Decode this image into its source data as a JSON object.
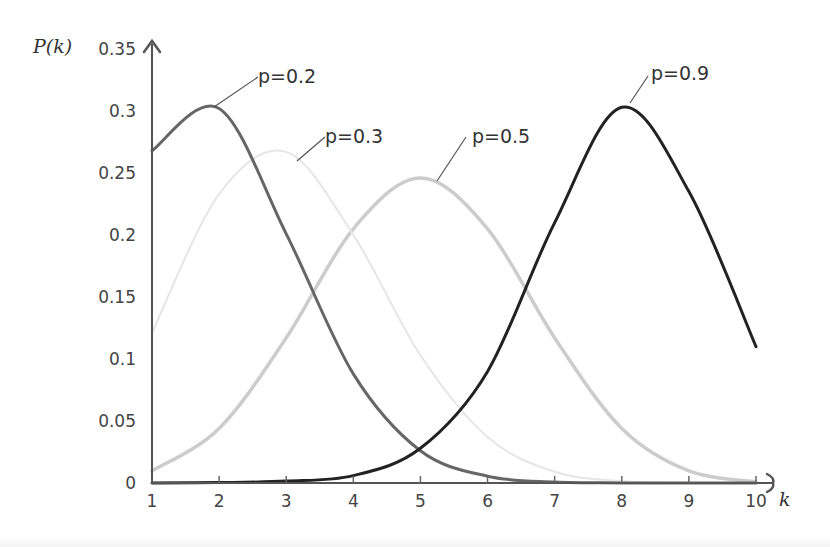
{
  "chart_data": {
    "type": "line",
    "title": "",
    "xlabel": "k",
    "ylabel": "P(k)",
    "x": [
      1,
      2,
      3,
      4,
      5,
      6,
      7,
      8,
      9,
      10
    ],
    "xlim": [
      1,
      10
    ],
    "ylim": [
      0,
      0.35
    ],
    "x_ticks": [
      "1",
      "2",
      "3",
      "4",
      "5",
      "6",
      "7",
      "8",
      "9",
      "10"
    ],
    "y_ticks": [
      "0",
      "0.05",
      "0.1",
      "0.15",
      "0.2",
      "0.25",
      "0.3",
      "0.35"
    ],
    "y_tick_values": [
      0,
      0.05,
      0.1,
      0.15,
      0.2,
      0.25,
      0.3,
      0.35
    ],
    "grid": false,
    "legend": "inline labels with leader lines",
    "series": [
      {
        "name": "p=0.2",
        "color": "#666666",
        "width": 3,
        "values": [
          0.268,
          0.302,
          0.201,
          0.088,
          0.026,
          0.0055,
          0.0008,
          0.0001,
          0.0,
          0.0
        ]
      },
      {
        "name": "p=0.3",
        "color": "#e6e6e6",
        "width": 2,
        "values": [
          0.121,
          0.233,
          0.267,
          0.2,
          0.103,
          0.037,
          0.009,
          0.0014,
          0.0001,
          0.0
        ]
      },
      {
        "name": "p=0.5",
        "color": "#cccccc",
        "width": 3.5,
        "values": [
          0.0098,
          0.044,
          0.117,
          0.205,
          0.246,
          0.205,
          0.117,
          0.044,
          0.0098,
          0.001
        ]
      },
      {
        "name": "p=0.9",
        "color": "#222222",
        "width": 3,
        "values": [
          0.0,
          0.0003,
          0.0015,
          0.006,
          0.028,
          0.09,
          0.21,
          0.303,
          0.235,
          0.11
        ]
      }
    ],
    "annotations": [
      {
        "text": "p=0.2",
        "label_x": 258,
        "label_y": 83,
        "leader": [
          [
            258,
            77
          ],
          [
            214,
            107
          ]
        ]
      },
      {
        "text": "p=0.3",
        "label_x": 325,
        "label_y": 143,
        "leader": [
          [
            325,
            137
          ],
          [
            297,
            161
          ]
        ]
      },
      {
        "text": "p=0.5",
        "label_x": 472,
        "label_y": 143,
        "leader": [
          [
            466,
            137
          ],
          [
            437,
            181
          ]
        ]
      },
      {
        "text": "p=0.9",
        "label_x": 651,
        "label_y": 80,
        "leader": [
          [
            648,
            76
          ],
          [
            630,
            103
          ]
        ]
      }
    ]
  }
}
